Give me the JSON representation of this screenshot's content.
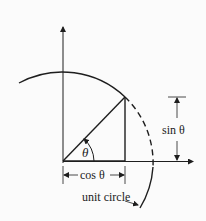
{
  "diagram": {
    "type": "unit-circle-trig",
    "labels": {
      "angle": "θ",
      "cos": "cos θ",
      "sin": "sin θ",
      "circle": "unit circle"
    },
    "colors": {
      "stroke": "#1e1e1e",
      "background": "#fbfbfb"
    }
  }
}
